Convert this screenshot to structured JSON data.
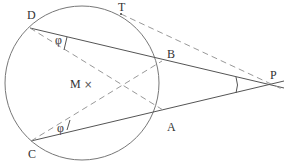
{
  "diagram": {
    "colors": {
      "stroke": "#555555",
      "dashed": "#999999",
      "text": "#333333"
    },
    "circle": {
      "center": [
        82,
        83
      ],
      "radius": 77,
      "center_label": "M",
      "center_marker": "×"
    },
    "points": {
      "D": {
        "label": "D",
        "pos": [
          30,
          28
        ]
      },
      "T": {
        "label": "T",
        "pos": [
          121,
          14
        ]
      },
      "B": {
        "label": "B",
        "pos": [
          162,
          61
        ]
      },
      "A": {
        "label": "A",
        "pos": [
          163,
          110
        ]
      },
      "C": {
        "label": "C",
        "pos": [
          31,
          141
        ]
      },
      "P": {
        "label": "P",
        "pos": [
          268,
          85
        ]
      }
    },
    "angles": {
      "at_D": "φ",
      "at_C": "φ"
    },
    "lines": [
      {
        "from": "D",
        "to": "P",
        "style": "solid"
      },
      {
        "from": "C",
        "to": "P",
        "style": "solid"
      },
      {
        "from": "D",
        "to": "A",
        "style": "dashed"
      },
      {
        "from": "C",
        "to": "B",
        "style": "dashed"
      },
      {
        "from": "T",
        "to": "P",
        "style": "dashed"
      }
    ]
  }
}
